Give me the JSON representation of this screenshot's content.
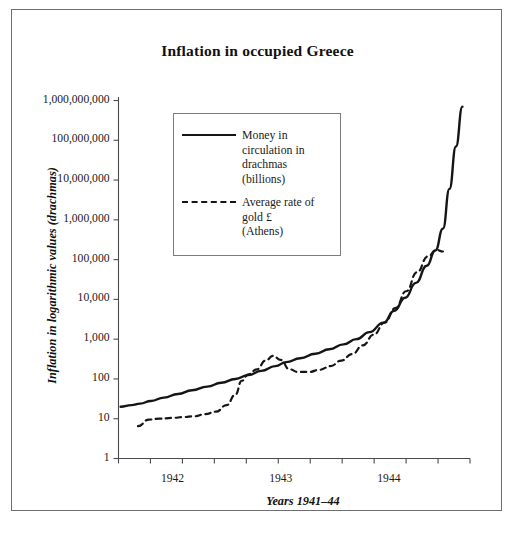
{
  "chart_data": {
    "type": "line",
    "title": "Inflation in occupied Greece",
    "xlabel": "Years 1941–44",
    "ylabel": "Inflation in logarithmic values (drachmas)",
    "yscale": "log",
    "ylim": [
      1,
      1000000000
    ],
    "xlim": [
      1941.5,
      1944.75
    ],
    "grid": false,
    "legend_position": "upper-left-inside",
    "ytick_labels": [
      "1,000,000,000",
      "100,000,000",
      "10,000,000",
      "1,000,000",
      "100,000",
      "10,000",
      "1,000",
      "100",
      "10",
      "1"
    ],
    "ytick_values": [
      1000000000,
      100000000,
      10000000,
      1000000,
      100000,
      10000,
      1000,
      100,
      10,
      1
    ],
    "xtick_labels": [
      "1942",
      "1943",
      "1944"
    ],
    "xtick_values": [
      1942,
      1943,
      1944
    ],
    "x_minor_tick_count": 11,
    "series": [
      {
        "name": "Money in circulation in drachmas (billions)",
        "style": "solid",
        "color": "#151515",
        "points": [
          [
            1941.52,
            20
          ],
          [
            1941.62,
            22
          ],
          [
            1941.7,
            24
          ],
          [
            1941.8,
            28
          ],
          [
            1941.92,
            34
          ],
          [
            1942.05,
            42
          ],
          [
            1942.18,
            52
          ],
          [
            1942.32,
            64
          ],
          [
            1942.45,
            80
          ],
          [
            1942.58,
            100
          ],
          [
            1942.7,
            125
          ],
          [
            1942.82,
            160
          ],
          [
            1942.95,
            210
          ],
          [
            1943.05,
            265
          ],
          [
            1943.18,
            330
          ],
          [
            1943.32,
            430
          ],
          [
            1943.45,
            560
          ],
          [
            1943.58,
            740
          ],
          [
            1943.7,
            1000
          ],
          [
            1943.82,
            1500
          ],
          [
            1943.95,
            2600
          ],
          [
            1944.05,
            5200
          ],
          [
            1944.15,
            11000
          ],
          [
            1944.25,
            26000
          ],
          [
            1944.35,
            70000
          ],
          [
            1944.43,
            170000
          ],
          [
            1944.5,
            600000
          ],
          [
            1944.56,
            6000000
          ],
          [
            1944.62,
            70000000
          ],
          [
            1944.68,
            700000000
          ]
        ]
      },
      {
        "name": "Average rate of gold £ (Athens)",
        "style": "dashed",
        "color": "#151515",
        "points": [
          [
            1941.68,
            6.5
          ],
          [
            1941.78,
            9.5
          ],
          [
            1941.88,
            10
          ],
          [
            1942.0,
            10.5
          ],
          [
            1942.1,
            11
          ],
          [
            1942.2,
            11.5
          ],
          [
            1942.3,
            13
          ],
          [
            1942.4,
            15
          ],
          [
            1942.5,
            22
          ],
          [
            1942.58,
            40
          ],
          [
            1942.64,
            90
          ],
          [
            1942.7,
            130
          ],
          [
            1942.78,
            175
          ],
          [
            1942.86,
            290
          ],
          [
            1942.93,
            380
          ],
          [
            1943.0,
            300
          ],
          [
            1943.08,
            175
          ],
          [
            1943.16,
            150
          ],
          [
            1943.26,
            150
          ],
          [
            1943.36,
            170
          ],
          [
            1943.46,
            210
          ],
          [
            1943.56,
            290
          ],
          [
            1943.66,
            420
          ],
          [
            1943.76,
            700
          ],
          [
            1943.86,
            1300
          ],
          [
            1943.96,
            2600
          ],
          [
            1944.06,
            6000
          ],
          [
            1944.16,
            16000
          ],
          [
            1944.26,
            48000
          ],
          [
            1944.36,
            120000
          ],
          [
            1944.44,
            175000
          ],
          [
            1944.5,
            160000
          ]
        ]
      }
    ]
  },
  "title": {
    "text": "Inflation in occupied Greece"
  },
  "axes": {
    "ylabel": "Inflation in logarithmic values (drachmas)",
    "xlabel": "Years 1941–44"
  },
  "legend": {
    "entries": [
      {
        "style": "solid",
        "lines": [
          "Money in",
          "circulation in",
          "drachmas",
          "(billions)"
        ]
      },
      {
        "style": "dashed",
        "lines": [
          "Average rate of",
          "gold £",
          "(Athens)"
        ]
      }
    ]
  }
}
